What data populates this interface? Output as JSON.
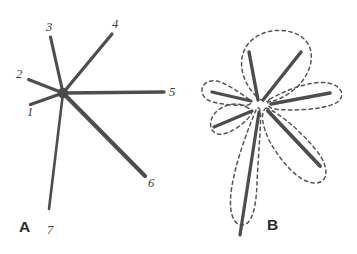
{
  "figure": {
    "background_color": "#ffffff",
    "ray_color": "#4d4d4d",
    "outline_color": "#555555",
    "hub_color": "#4a4a4a",
    "label_color": "#3d3d3d"
  },
  "panels": [
    {
      "id": "A",
      "label": "A",
      "label_pos": {
        "x": 19,
        "y": 232
      },
      "description": "Seven numbered rays radiating from a central filled hub",
      "hub": {
        "x": 63,
        "y": 93,
        "r": 5.2
      },
      "rays": [
        {
          "number": "1",
          "x1": 63,
          "y1": 93,
          "x2": 30.5,
          "y2": 104.5,
          "width": 3.4,
          "label_x": 27,
          "label_y": 116
        },
        {
          "number": "2",
          "x1": 63,
          "y1": 93,
          "x2": 28.5,
          "y2": 79.5,
          "width": 3.0,
          "label_x": 16,
          "label_y": 78
        },
        {
          "number": "3",
          "x1": 63,
          "y1": 93,
          "x2": 50.5,
          "y2": 37.0,
          "width": 3.1,
          "label_x": 46,
          "label_y": 31
        },
        {
          "number": "4",
          "x1": 63,
          "y1": 93,
          "x2": 112.0,
          "y2": 34.0,
          "width": 3.2,
          "label_x": 112,
          "label_y": 28
        },
        {
          "number": "5",
          "x1": 63,
          "y1": 93,
          "x2": 164.0,
          "y2": 92.0,
          "width": 3.3,
          "label_x": 169,
          "label_y": 96
        },
        {
          "number": "6",
          "x1": 63,
          "y1": 93,
          "x2": 145.0,
          "y2": 176.0,
          "width": 4.1,
          "label_x": 148,
          "label_y": 187
        },
        {
          "number": "7",
          "x1": 63,
          "y1": 93,
          "x2": 49.0,
          "y2": 209.0,
          "width": 2.6,
          "label_x": 47,
          "label_y": 234
        }
      ]
    },
    {
      "id": "B",
      "label": "B",
      "label_pos": {
        "x": 267,
        "y": 230
      },
      "description": "Same ray pattern enclosed by dashed petal-shaped lobe outlines",
      "hub": {
        "x": 261,
        "y": 103,
        "r": 0
      },
      "rays": [
        {
          "number": "1",
          "x1": 252,
          "y1": 111,
          "x2": 214.0,
          "y2": 127.0,
          "width": 3.2
        },
        {
          "number": "2",
          "x1": 251,
          "y1": 101,
          "x2": 212.0,
          "y2": 92.0,
          "width": 3.2
        },
        {
          "number": "3",
          "x1": 258,
          "y1": 100,
          "x2": 249.0,
          "y2": 52.0,
          "width": 3.4
        },
        {
          "number": "4",
          "x1": 263,
          "y1": 100,
          "x2": 301.0,
          "y2": 52.0,
          "width": 3.4
        },
        {
          "number": "5",
          "x1": 271,
          "y1": 104,
          "x2": 330.0,
          "y2": 93.0,
          "width": 3.5
        },
        {
          "number": "6",
          "x1": 268,
          "y1": 111,
          "x2": 320.0,
          "y2": 166.0,
          "width": 3.9
        },
        {
          "number": "7",
          "x1": 259,
          "y1": 112,
          "x2": 240.0,
          "y2": 235.0,
          "width": 3.2
        }
      ],
      "lobes": [
        {
          "for_ray": "1",
          "path": "M 248,108 C 238,101 224,104 216,112 C 208,120 209,132 218,134 C 228,136 244,124 250,116 C 253,112 252,110 248,108 Z"
        },
        {
          "for_ray": "2",
          "path": "M 249,99 C 238,92 222,79 211,81 C 200,83 199,95 208,100 C 218,105 240,106 248,105 C 252,104 252,101 249,99 Z"
        },
        {
          "for_ray": "3+4",
          "path": "M 256,96 C 242,82 236,60 248,44 C 262,27 290,27 303,38 C 317,50 312,72 298,86 C 288,96 272,104 264,101 C 259,99 258,98 256,96 Z"
        },
        {
          "for_ray": "5",
          "path": "M 270,99 C 286,90 312,80 328,83 C 344,86 346,99 334,104 C 320,110 290,111 274,109 C 268,108 266,102 270,99 Z"
        },
        {
          "for_ray": "6",
          "path": "M 266,108 C 278,112 300,130 316,150 C 331,168 328,184 314,183 C 298,182 280,160 270,142 C 262,126 260,112 266,108 Z"
        },
        {
          "for_ray": "7",
          "path": "M 256,110 C 250,124 236,160 232,186 C 228,208 232,224 241,225 C 252,226 256,208 257,184 C 258,156 262,118 260,110 C 259,107 257,107 256,110 Z"
        }
      ]
    }
  ]
}
